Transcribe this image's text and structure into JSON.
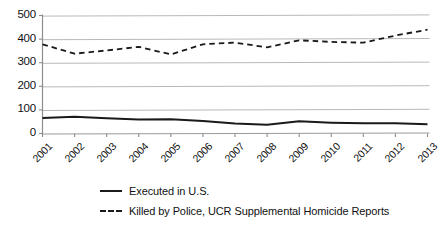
{
  "chart_data": {
    "type": "line",
    "title": "",
    "xlabel": "",
    "ylabel": "",
    "grid": true,
    "legend_position": "bottom-left",
    "categories": [
      "2001",
      "2002",
      "2003",
      "2004",
      "2005",
      "2006",
      "2007",
      "2008",
      "2009",
      "2010",
      "2011",
      "2012",
      "2013"
    ],
    "xlim": [
      2001,
      2013
    ],
    "ylim": [
      0,
      500
    ],
    "yticks": [
      0,
      100,
      200,
      300,
      400,
      500
    ],
    "series": [
      {
        "name": "Executed in U.S.",
        "style": "solid",
        "color": "#1a1a1a",
        "values": [
          66,
          71,
          65,
          59,
          60,
          53,
          42,
          37,
          52,
          46,
          43,
          43,
          39
        ]
      },
      {
        "name": "Killed by Police, UCR Supplemental Homicide Reports",
        "style": "dashed",
        "color": "#1a1a1a",
        "values": [
          378,
          338,
          352,
          367,
          335,
          378,
          385,
          365,
          395,
          388,
          385,
          415,
          440
        ]
      }
    ]
  },
  "axis": {
    "y_labels": [
      "500",
      "400",
      "300",
      "200",
      "100",
      "0"
    ],
    "x_labels": [
      "2001",
      "2002",
      "2003",
      "2004",
      "2005",
      "2006",
      "2007",
      "2008",
      "2009",
      "2010",
      "2011",
      "2012",
      "2013"
    ]
  },
  "legend": {
    "items": [
      {
        "label": "Executed in U.S.",
        "style": "solid"
      },
      {
        "label": "Killed by Police, UCR Supplemental Homicide Reports",
        "style": "dashed"
      }
    ]
  }
}
